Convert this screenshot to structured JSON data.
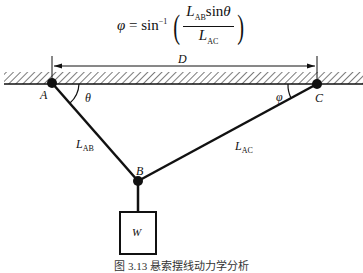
{
  "formula": {
    "lhs": "φ",
    "equals": "=",
    "func": "sin",
    "exponent": "−1",
    "numerator_L": "L",
    "numerator_sub": "AB",
    "numerator_func": "sin",
    "numerator_angle": "θ",
    "denominator_L": "L",
    "denominator_sub": "AC"
  },
  "labels": {
    "dimension": "D",
    "point_a": "A",
    "point_b": "B",
    "point_c": "C",
    "angle_theta": "θ",
    "angle_phi": "φ",
    "link_ab": "L",
    "link_ab_sub": "AB",
    "link_ac": "L",
    "link_ac_sub": "AC",
    "weight": "W"
  },
  "caption": "图 3.13  悬索摆线动力学分析",
  "geometry": {
    "A": [
      52,
      83
    ],
    "B": [
      138,
      181
    ],
    "C": [
      317,
      84
    ],
    "ground_y": [
      72,
      84
    ],
    "dim_line_y": 66,
    "weight_box": [
      120,
      212,
      36,
      42
    ]
  },
  "colors": {
    "ink": "#111111",
    "background": "#ffffff"
  }
}
